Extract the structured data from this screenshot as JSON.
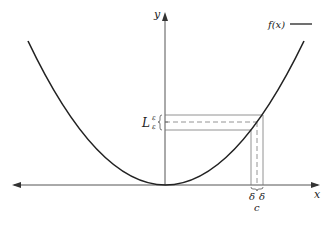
{
  "diagram": {
    "axes": {
      "x_label": "x",
      "y_label": "y"
    },
    "legend": {
      "label": "f(x)",
      "line_color": "#222222"
    },
    "curve": {
      "type": "parabola",
      "vertex": "origin",
      "color": "#222222"
    },
    "annotations": {
      "limit_label": "L",
      "epsilon_upper": "ε",
      "epsilon_lower": "ε",
      "delta_left": "δ",
      "delta_right": "δ",
      "point_label": "c"
    },
    "colors": {
      "axis": "#555555",
      "guide": "#777777",
      "dashed": "#888888"
    }
  }
}
